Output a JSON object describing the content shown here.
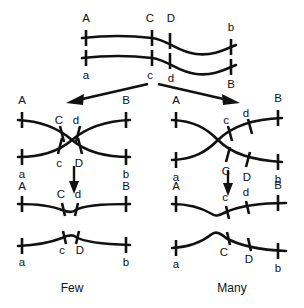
{
  "figure": {
    "captions": {
      "left": "Few",
      "right": "Many"
    }
  },
  "panels": {
    "parental": {
      "name": "parental-chromatids",
      "upper_strand": {
        "labels": [
          "A",
          "C",
          "D",
          "b"
        ],
        "label_positions": [
          "above",
          "above",
          "above",
          "above"
        ]
      },
      "lower_strand": {
        "labels": [
          "a",
          "c",
          "d",
          "B"
        ],
        "label_positions": [
          "below",
          "below",
          "below",
          "below"
        ]
      }
    },
    "left_crossover": {
      "name": "few-crossover-pairing",
      "upper_left_label": "A",
      "upper_right_label": "B",
      "lower_left_label": "a",
      "lower_right_label": "b",
      "inner_upper_labels": [
        "C",
        "d"
      ],
      "inner_lower_labels": [
        "c",
        "D"
      ]
    },
    "right_crossover": {
      "name": "many-crossover-pairing",
      "upper_left_label": "A",
      "upper_right_label": "B",
      "lower_left_label": "a",
      "lower_right_label": "b",
      "inner_upper_labels": [
        "c",
        "d"
      ],
      "inner_lower_labels": [
        "C",
        "D"
      ]
    },
    "left_result": {
      "name": "few-crossover-result",
      "upper_strand": {
        "left_label": "A",
        "right_label": "B",
        "inner_labels": [
          "C",
          "d"
        ]
      },
      "lower_strand": {
        "left_label": "a",
        "right_label": "b",
        "inner_labels": [
          "c",
          "D"
        ]
      }
    },
    "right_result": {
      "name": "many-crossover-result",
      "upper_strand": {
        "left_label": "A",
        "right_label": "B",
        "inner_labels": [
          "c",
          "d"
        ]
      },
      "lower_strand": {
        "left_label": "a",
        "right_label": "b",
        "inner_labels": [
          "C",
          "D"
        ]
      }
    }
  },
  "arrows": {
    "branch_left": "diagonal-arrow-to-left-panel",
    "branch_right": "diagonal-arrow-to-right-panel",
    "left_down": "downward-arrow-left",
    "right_down": "downward-arrow-right"
  },
  "colors": {
    "stroke": "#111111",
    "background": "#ffffff"
  }
}
